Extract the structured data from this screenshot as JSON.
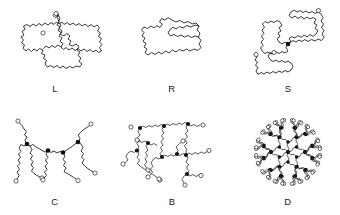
{
  "figure": {
    "background_color": "#ffffff",
    "line_color": "#222222",
    "junction_color": "#111111",
    "endcap_fill": "#ffffff",
    "width": 340,
    "height": 215,
    "rows": 2,
    "columns": 3
  },
  "panels": [
    {
      "id": "linear",
      "label": "L",
      "architecture": "linear",
      "row": 1,
      "column": 1,
      "junction_count": 0,
      "endcap_count": 2,
      "label_x": 55,
      "label_y": 92
    },
    {
      "id": "ring",
      "label": "R",
      "architecture": "ring",
      "row": 1,
      "column": 2,
      "junction_count": 0,
      "endcap_count": 0,
      "label_x": 172,
      "label_y": 92
    },
    {
      "id": "star",
      "label": "S",
      "architecture": "star",
      "row": 1,
      "column": 3,
      "junction_count": 1,
      "endcap_count": 3,
      "label_x": 288,
      "label_y": 92
    },
    {
      "id": "comb",
      "label": "C",
      "architecture": "comb",
      "row": 2,
      "column": 1,
      "junction_count": 4,
      "endcap_count": 7,
      "label_x": 55,
      "label_y": 205
    },
    {
      "id": "branched",
      "label": "B",
      "architecture": "branched",
      "row": 2,
      "column": 2,
      "junction_count": 9,
      "endcap_count": 12,
      "label_x": 172,
      "label_y": 205
    },
    {
      "id": "dendrimer",
      "label": "D",
      "architecture": "dendrimer",
      "row": 2,
      "column": 3,
      "junction_count": 31,
      "endcap_count": 48,
      "label_x": 288,
      "label_y": 205
    }
  ],
  "chart_data": {
    "type": "diagram",
    "title": "",
    "subtitle": "",
    "xlabel": "",
    "ylabel": "",
    "legend": [],
    "categories": [
      "L",
      "R",
      "S",
      "C",
      "B",
      "D"
    ],
    "series": [
      {
        "name": "architecture",
        "values": [
          "linear",
          "ring",
          "star",
          "comb",
          "branched",
          "dendrimer"
        ]
      },
      {
        "name": "branch_points",
        "values": [
          0,
          0,
          1,
          4,
          9,
          31
        ]
      },
      {
        "name": "chain_ends",
        "values": [
          2,
          0,
          3,
          7,
          12,
          48
        ]
      }
    ]
  }
}
